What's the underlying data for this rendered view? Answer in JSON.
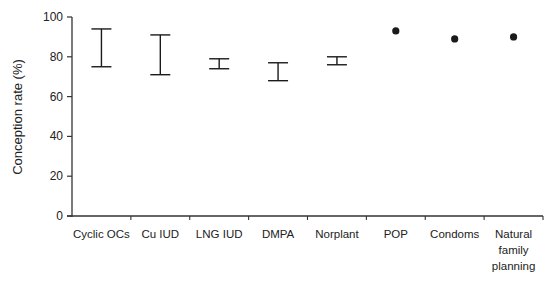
{
  "chart_data": {
    "type": "range-and-point",
    "title": "",
    "xlabel": "",
    "ylabel": "Conception rate (%)",
    "ylim": [
      0,
      100
    ],
    "yticks": [
      0,
      20,
      40,
      60,
      80,
      100
    ],
    "grid": false,
    "legend": null,
    "categories": [
      "Cyclic OCs",
      "Cu IUD",
      "LNG IUD",
      "DMPA",
      "Norplant",
      "POP",
      "Condoms",
      "Natural family planning"
    ],
    "category_label_lines": [
      [
        "Cyclic OCs"
      ],
      [
        "Cu IUD"
      ],
      [
        "LNG IUD"
      ],
      [
        "DMPA"
      ],
      [
        "Norplant"
      ],
      [
        "POP"
      ],
      [
        "Condoms"
      ],
      [
        "Natural",
        "family",
        "planning"
      ]
    ],
    "ranges": [
      {
        "category": "Cyclic OCs",
        "low": 75,
        "high": 94
      },
      {
        "category": "Cu IUD",
        "low": 71,
        "high": 91
      },
      {
        "category": "LNG IUD",
        "low": 74,
        "high": 79
      },
      {
        "category": "DMPA",
        "low": 68,
        "high": 77
      },
      {
        "category": "Norplant",
        "low": 76,
        "high": 80
      }
    ],
    "points": [
      {
        "category": "POP",
        "value": 93
      },
      {
        "category": "Condoms",
        "value": 89
      },
      {
        "category": "Natural family planning",
        "value": 90
      }
    ],
    "colors": {
      "ink": "#1a1a1a",
      "axis": "#333333"
    }
  }
}
